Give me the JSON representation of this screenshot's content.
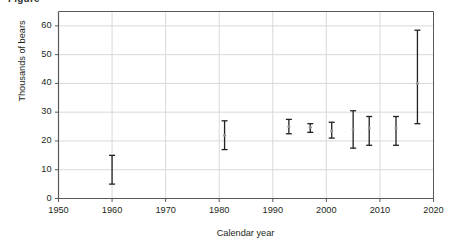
{
  "figure": {
    "clipped_title": "Figure",
    "xlabel": "Calendar year",
    "ylabel": "Thousands of bears"
  },
  "chart_data": {
    "type": "scatter",
    "title": "",
    "subtitle": "",
    "xlabel": "Calendar year",
    "ylabel": "Thousands of bears",
    "xlim": [
      1950,
      2020
    ],
    "ylim": [
      0,
      65
    ],
    "xticks": [
      1950,
      1960,
      1970,
      1980,
      1990,
      2000,
      2010,
      2020
    ],
    "yticks": [
      0,
      10,
      20,
      30,
      40,
      50,
      60
    ],
    "xtick_labels": [
      "1950",
      "1960",
      "1970",
      "1980",
      "1990",
      "2000",
      "2010",
      "2020"
    ],
    "ytick_labels": [
      "0",
      "10",
      "20",
      "30",
      "40",
      "50",
      "60"
    ],
    "grid": "horizontal-and-vertical",
    "legend": "none",
    "marker": "error-bar-with-center-dot",
    "series": [
      {
        "name": "Global polar bear abundance estimate",
        "x": [
          1960,
          1981,
          1993,
          1997,
          2001,
          2005,
          2008,
          2013,
          2017
        ],
        "values": [
          10.0,
          22.0,
          25.0,
          24.8,
          23.5,
          24.0,
          24.5,
          24.5,
          40.0
        ],
        "error_low": [
          5.0,
          17.0,
          22.5,
          23.0,
          21.0,
          17.5,
          18.5,
          18.5,
          26.0
        ],
        "error_high": [
          15.0,
          27.0,
          27.5,
          26.0,
          26.5,
          30.5,
          28.5,
          28.5,
          58.5
        ],
        "center_marker_shown": [
          false,
          true,
          true,
          true,
          true,
          true,
          true,
          true,
          true
        ]
      }
    ]
  },
  "colors": {
    "axis": "#58595b",
    "grid": "#d8d9da",
    "errorbar": "#231f20",
    "center_dot": "#8d8e90",
    "text": "#231f20",
    "background": "#ffffff"
  }
}
